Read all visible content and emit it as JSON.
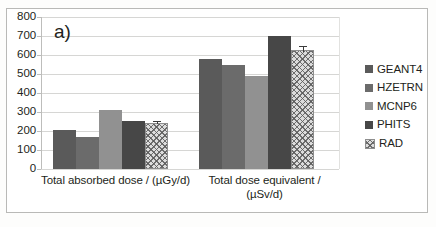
{
  "panel": {
    "letter": "a)"
  },
  "chart_data": {
    "type": "bar",
    "title": "",
    "subtitle": "",
    "xlabel": "",
    "ylabel": "",
    "ylim": [
      0,
      800
    ],
    "ytick_step": 100,
    "grid": true,
    "legend_position": "right",
    "categories": [
      "Total absorbed dose / (µGy/d)",
      "Total dose equivalent / (µSv/d)"
    ],
    "category_lines": [
      [
        "Total absorbed dose / (µGy/d)"
      ],
      [
        "Total dose equivalent /",
        "(µSv/d)"
      ]
    ],
    "yticks": [
      "0",
      "100",
      "200",
      "300",
      "400",
      "500",
      "600",
      "700",
      "800"
    ],
    "series": [
      {
        "name": "GEANT4",
        "color": "#5a5a5a",
        "pattern": "solid",
        "values": [
          205,
          578
        ],
        "errors": [
          0,
          0
        ]
      },
      {
        "name": "HZETRN",
        "color": "#6b6b6b",
        "pattern": "solid",
        "values": [
          170,
          548
        ],
        "errors": [
          0,
          0
        ]
      },
      {
        "name": "MCNP6",
        "color": "#919191",
        "pattern": "solid",
        "values": [
          310,
          488
        ],
        "errors": [
          0,
          0
        ]
      },
      {
        "name": "PHITS",
        "color": "#474747",
        "pattern": "solid",
        "values": [
          252,
          702
        ],
        "errors": [
          0,
          0
        ]
      },
      {
        "name": "RAD",
        "color": "#dcdcdc",
        "pattern": "crosshatch",
        "values": [
          242,
          628
        ],
        "errors": [
          12,
          28
        ]
      }
    ]
  }
}
